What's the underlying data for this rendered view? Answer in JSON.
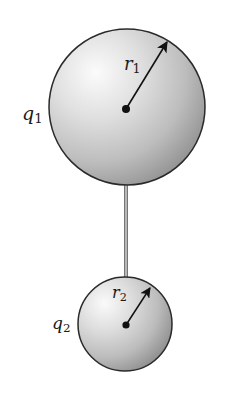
{
  "diagram": {
    "colors": {
      "background": "#ffffff",
      "sphere_highlight": "#fbfbfb",
      "sphere_mid": "#c9c9c9",
      "sphere_shadow": "#8e8e8e",
      "outline": "#2a2a2a",
      "rod_edge": "#555555",
      "rod_center": "#d8d8d8",
      "arrow": "#111111"
    },
    "spheres": [
      {
        "id": "sphere-1",
        "charge_label": {
          "symbol": "q",
          "subscript": "1"
        },
        "radius_label": {
          "symbol": "r",
          "subscript": "1"
        },
        "center": [
          127,
          107
        ],
        "radius": 78,
        "center_dot": [
          126,
          109
        ],
        "arrow_tip": [
          168,
          41
        ]
      },
      {
        "id": "sphere-2",
        "charge_label": {
          "symbol": "q",
          "subscript": "2"
        },
        "radius_label": {
          "symbol": "r",
          "subscript": "2"
        },
        "center": [
          125,
          324
        ],
        "radius": 47,
        "center_dot": [
          126,
          325
        ],
        "arrow_tip": [
          151,
          287
        ]
      }
    ],
    "rod": {
      "x": 124,
      "width": 4,
      "y_top": 183,
      "y_bottom": 279
    }
  }
}
